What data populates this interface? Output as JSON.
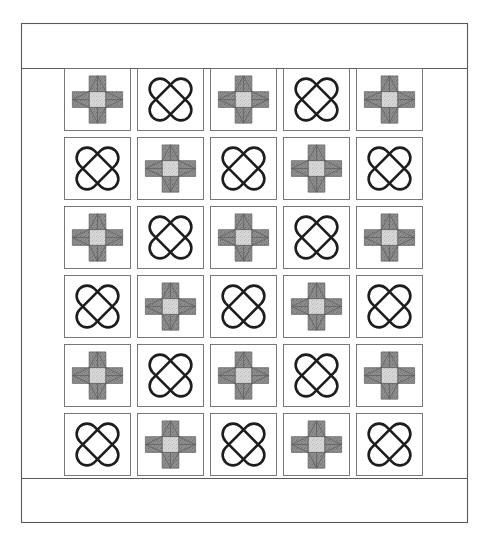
{
  "document": {
    "title": "Quilt Block Layout Diagram",
    "kind": "quilt-layout-diagram"
  },
  "canvas": {
    "width": 489,
    "height": 545,
    "background": "#ffffff"
  },
  "frame": {
    "name": "outer-quilt-border",
    "x": 21,
    "y": 23,
    "width": 447,
    "height": 500,
    "stroke": "#5a5a5a",
    "fill": "#ffffff",
    "top_border_height": 45,
    "bottom_border_height": 45,
    "side_border_width": 43
  },
  "grid": {
    "columns": 5,
    "rows": 6,
    "x": 64,
    "y": 68,
    "width": 361,
    "height": 410,
    "cell_width": 70,
    "cell_height": 66,
    "sashing_width": 3,
    "sashing_color": "#6a6a6a",
    "column_positions": [
      64,
      137,
      210,
      283,
      356
    ],
    "row_positions": [
      68,
      137,
      206,
      275,
      344,
      413
    ]
  },
  "colors": {
    "star_center_light": "#d3d3d3",
    "star_point_dark": "#8a8a8a",
    "background_white": "#ffffff",
    "outline_gray": "#5f5f5f",
    "band_black": "#1d1d1d",
    "frame_gray": "#5a5a5a"
  },
  "blocks": {
    "types": [
      {
        "id": "star",
        "name": "variable-star-block",
        "label": "Variable Star",
        "description": "Nine-patch eight-pointed star: light gray center square, dark gray triangle star points on the four side units, white corner squares.",
        "center_fill": "#d3d3d3",
        "point_fill": "#8a8a8a"
      },
      {
        "id": "x",
        "name": "interlocking-x-block",
        "label": "Interlocking X",
        "description": "Two crossing rounded capsule bands forming an X, drawn as black outlines on white.",
        "band_stroke": "#1d1d1d",
        "band_count": 2
      }
    ],
    "layout": [
      [
        "star",
        "x",
        "star",
        "x",
        "star"
      ],
      [
        "x",
        "star",
        "x",
        "star",
        "x"
      ],
      [
        "star",
        "x",
        "star",
        "x",
        "star"
      ],
      [
        "x",
        "star",
        "x",
        "star",
        "x"
      ],
      [
        "star",
        "x",
        "star",
        "x",
        "star"
      ],
      [
        "x",
        "star",
        "x",
        "star",
        "x"
      ]
    ],
    "counts": {
      "total": 30,
      "star": 15,
      "x": 15
    }
  }
}
